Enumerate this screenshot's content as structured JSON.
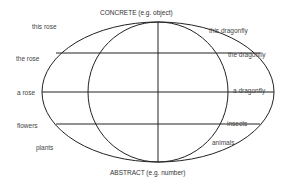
{
  "axes": {
    "top": "CONCRETE (e.g. object)",
    "bottom": "ABSTRACT (e.g. number)"
  },
  "left_labels": [
    "this rose",
    "the rose",
    "a rose",
    "flowers",
    "plants"
  ],
  "right_labels": [
    "this dragonfly",
    "the dragonfly",
    "a dragonfly",
    "insects",
    "animals"
  ],
  "colors": {
    "line": "#222222",
    "text": "#444444"
  }
}
